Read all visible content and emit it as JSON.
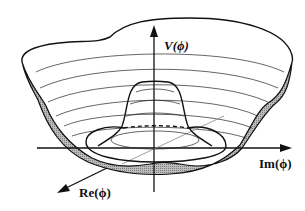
{
  "diagram": {
    "type": "mexican-hat-potential",
    "labels": {
      "vertical_axis": "V(ϕ)",
      "horizontal_axis": "Im(ϕ)",
      "depth_axis": "Re(ϕ)"
    },
    "colors": {
      "line": "#111111",
      "shaded_band": "#9a9a9a",
      "background": "#ffffff"
    }
  }
}
